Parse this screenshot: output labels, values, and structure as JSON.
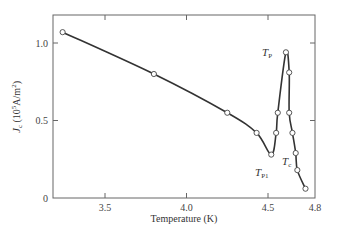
{
  "chart_data": {
    "type": "line",
    "title": "",
    "xlabel": "Temperature (K)",
    "ylabel": "J_c (10^5 A/m^2)",
    "ylabel_parts": {
      "main": "J",
      "sub": "c",
      "rest": " (10",
      "sup": "5",
      "unit": "A/m",
      "sup2": "2",
      "close": ")"
    },
    "xlim": [
      3.22,
      4.8
    ],
    "ylim": [
      0,
      1.2
    ],
    "x_ticks": [
      3.5,
      4.0,
      4.5,
      4.8
    ],
    "x_tick_labels": [
      "3.5",
      "4.0",
      "4.5",
      "4.8"
    ],
    "y_ticks": [
      0,
      0.5,
      1.0
    ],
    "y_tick_labels": [
      "0",
      "0.5",
      "1.0"
    ],
    "grid": false,
    "legend": null,
    "series": [
      {
        "name": "Jc vs T",
        "marker": "open-circle",
        "x": [
          3.24,
          3.8,
          4.25,
          4.43,
          4.52,
          4.55,
          4.56,
          4.61,
          4.63,
          4.63,
          4.65,
          4.67,
          4.68,
          4.73
        ],
        "y": [
          1.07,
          0.8,
          0.55,
          0.42,
          0.28,
          0.42,
          0.55,
          0.94,
          0.81,
          0.55,
          0.42,
          0.29,
          0.18,
          0.06
        ]
      }
    ],
    "annotations": [
      {
        "text": "T",
        "sub": "P",
        "x": 4.55,
        "y": 0.97
      },
      {
        "text": "T",
        "sub": "P1",
        "x": 4.52,
        "y": 0.16
      },
      {
        "text": "T",
        "sub": "c",
        "x": 4.72,
        "y": 0.22
      }
    ]
  }
}
